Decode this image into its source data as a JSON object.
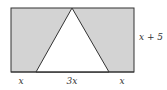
{
  "diagram": {
    "type": "geometry",
    "shapes": {
      "rectangle": {
        "fill": "#d3d3d3",
        "stroke": "#333333"
      },
      "triangle": {
        "fill": "#ffffff",
        "stroke": "#333333"
      }
    },
    "labels": {
      "left_segment": "x",
      "middle_segment": "3x",
      "right_segment": "x",
      "height": "x + 5"
    }
  }
}
